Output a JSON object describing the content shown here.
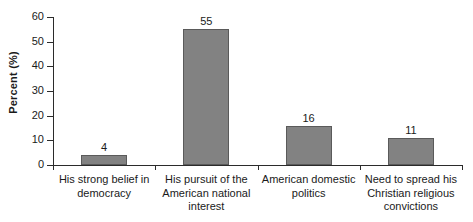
{
  "chart_data": {
    "type": "bar",
    "title": "",
    "subtitle": "",
    "xlabel": "",
    "ylabel": "Percent (%)",
    "ylim": [
      0,
      60
    ],
    "yticks": [
      0,
      10,
      20,
      30,
      40,
      50,
      60
    ],
    "ytick_labels": [
      "0",
      "10",
      "20",
      "30",
      "40",
      "50",
      "60"
    ],
    "grid": false,
    "legend": null,
    "categories": [
      "His strong belief in democracy",
      "His pursuit of the American national interest",
      "American domestic politics",
      "Need to spread his Christian religious convictions"
    ],
    "category_lines": [
      [
        "His strong belief in",
        "democracy"
      ],
      [
        "His pursuit of the",
        "American national",
        "interest"
      ],
      [
        "American domestic",
        "politics"
      ],
      [
        "Need to spread his",
        "Christian religious",
        "convictions"
      ]
    ],
    "values": [
      4,
      55,
      16,
      11
    ],
    "value_labels": [
      "4",
      "55",
      "16",
      "11"
    ],
    "bar_color": "#828282",
    "bar_edge_color": "#5a5a5a",
    "axis_color": "#2b2b2b",
    "text_color": "#1a1a1a",
    "background": "#ffffff"
  }
}
